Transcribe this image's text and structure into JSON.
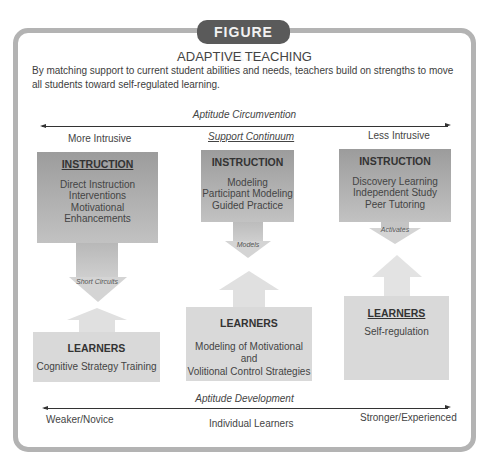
{
  "figure": {
    "badge": "FIGURE 11.1",
    "title": "ADAPTIVE TEACHING",
    "description": "By matching support to current student abilities and needs, teachers build on strengths to move all students toward self-regulated learning."
  },
  "top_axis": {
    "label": "Aptitude Circumvention",
    "left": "More Intrusive",
    "center": "Support Continuum",
    "right": "Less Intrusive"
  },
  "columns": [
    {
      "instruction": {
        "heading": "INSTRUCTION",
        "items": [
          "Direct Instruction",
          "Interventions",
          "Motivational Enhancements"
        ]
      },
      "connector": "Short Circuits",
      "learners": {
        "heading": "LEARNERS",
        "items": [
          "Cognitive Strategy Training"
        ]
      }
    },
    {
      "instruction": {
        "heading": "INSTRUCTION",
        "items": [
          "Modeling",
          "Participant Modeling",
          "Guided Practice"
        ]
      },
      "connector": "Models",
      "learners": {
        "heading": "LEARNERS",
        "items": [
          "Modeling of Motivational and",
          "Volitional Control Strategies"
        ]
      }
    },
    {
      "instruction": {
        "heading": "INSTRUCTION",
        "items": [
          "Discovery Learning",
          "Independent Study",
          "Peer Tutoring"
        ]
      },
      "connector": "Activates",
      "learners": {
        "heading": "LEARNERS",
        "items": [
          "Self-regulation"
        ]
      }
    }
  ],
  "bottom_axis": {
    "label": "Aptitude Development",
    "left": "Weaker/Novice",
    "center": "Individual Learners",
    "right": "Stronger/Experienced"
  },
  "colors": {
    "frame_border": "#b3b3b3",
    "badge_bg": "#5a5a5a",
    "instruction_top": "#9c9c9c",
    "instruction_bottom": "#c2c2c2",
    "learners_bg": "#d9d9d9"
  }
}
